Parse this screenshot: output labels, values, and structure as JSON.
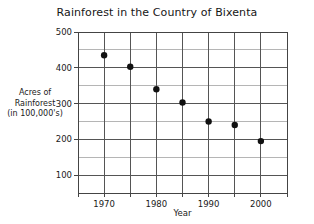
{
  "chart_data": {
    "type": "scatter",
    "title": "Rainforest in the Country of Bixenta",
    "xlabel": "Year",
    "ylabel_lines": [
      "Acres of",
      "Rainforest",
      "(in 100,000's)"
    ],
    "ylabel": "Acres of Rainforest (in 100,000's)",
    "x": [
      1970,
      1975,
      1980,
      1985,
      1990,
      1995,
      2000
    ],
    "values": [
      435,
      403,
      340,
      303,
      250,
      240,
      195
    ],
    "points": [
      {
        "x": 1970,
        "y": 435
      },
      {
        "x": 1975,
        "y": 403
      },
      {
        "x": 1980,
        "y": 340
      },
      {
        "x": 1985,
        "y": 303
      },
      {
        "x": 1990,
        "y": 250
      },
      {
        "x": 1995,
        "y": 240
      },
      {
        "x": 2000,
        "y": 195
      }
    ],
    "xlim": [
      1965,
      2005
    ],
    "ylim": [
      50,
      500
    ],
    "xticks": [
      1970,
      1980,
      1990,
      2000
    ],
    "xtick_labels": [
      "1970",
      "1980",
      "1990",
      "2000"
    ],
    "yticks": [
      100,
      200,
      300,
      400,
      500
    ],
    "ytick_labels": [
      "100",
      "200",
      "300",
      "400",
      "500"
    ],
    "x_gridlines": [
      1965,
      1970,
      1975,
      1980,
      1985,
      1990,
      1995,
      2000,
      2005
    ],
    "y_gridlines_major": [
      100,
      200,
      300,
      400,
      500
    ],
    "y_gridlines_minor": [
      150,
      250,
      350,
      450
    ],
    "grid": true,
    "legend": "none",
    "colors": {
      "marker": "#111111",
      "grid_major": "#555555",
      "grid_minor": "#b5b5b5",
      "frame": "#444444",
      "text": "#1a1a1a",
      "background": "#ffffff"
    },
    "marker_radius_px": 3.2
  }
}
